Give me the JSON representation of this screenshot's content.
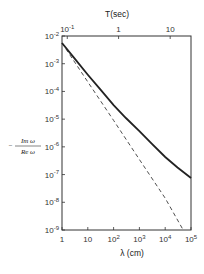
{
  "chart_data": {
    "type": "line",
    "title": "",
    "xlabel": "λ (cm)",
    "ylabel": "- Im ω / Re ω",
    "top_xlabel": "T(sec)",
    "x_scale": "log",
    "y_scale": "log",
    "xlim": [
      1,
      100000
    ],
    "ylim": [
      1e-09,
      0.01
    ],
    "x_ticks": [
      "1",
      "10",
      "10^2",
      "10^3",
      "10^4",
      "10^5"
    ],
    "y_ticks": [
      "10^-9",
      "10^-8",
      "10^-7",
      "10^-6",
      "10^-5",
      "10^-4",
      "10^-3",
      "10^-2"
    ],
    "top_ticks": [
      {
        "label": "10^-1",
        "lambda": 1.6
      },
      {
        "label": "1",
        "lambda": 156
      },
      {
        "label": "10",
        "lambda": 15600
      }
    ],
    "grid": false,
    "legend": null,
    "series": [
      {
        "name": "solid",
        "style": "solid",
        "x": [
          1,
          3,
          10,
          30,
          100,
          300,
          1000,
          3000,
          10000,
          30000,
          100000
        ],
        "y": [
          0.0056,
          0.0016,
          0.0004,
          0.00012,
          3.2e-05,
          1.1e-05,
          3.7e-06,
          1.3e-06,
          4.3e-07,
          1.8e-07,
          7.5e-08
        ]
      },
      {
        "name": "dashed",
        "style": "dashed",
        "x": [
          1,
          10,
          100,
          1000,
          10000,
          50000
        ],
        "y": [
          0.0056,
          0.00022,
          9e-06,
          3.5e-07,
          1.4e-08,
          1e-09
        ]
      }
    ]
  },
  "labels": {
    "top_axis_title": "T(sec)",
    "bottom_axis_title": "λ (cm)",
    "ylabel_num": "Im ω",
    "ylabel_den": "Re ω",
    "ylabel_sign": "−"
  }
}
